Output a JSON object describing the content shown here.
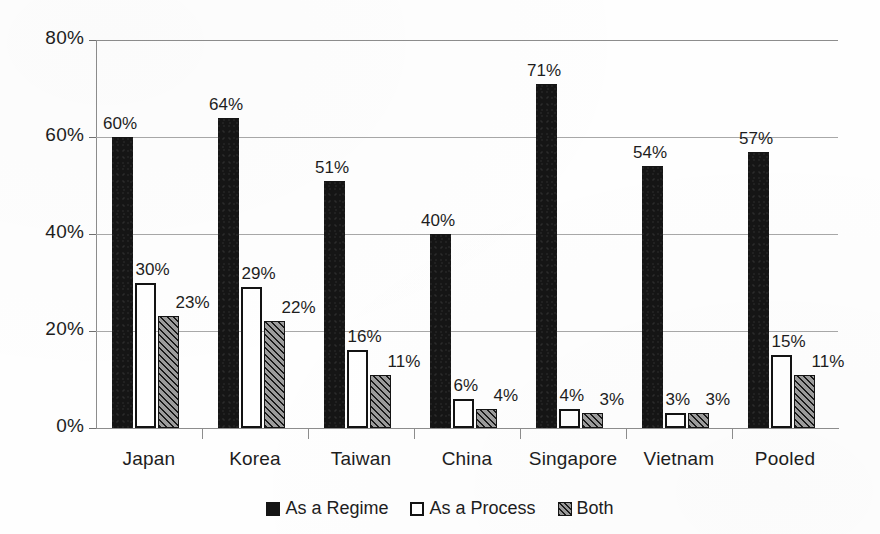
{
  "chart_data": {
    "type": "bar",
    "title": "",
    "subtitle": "",
    "xlabel": "",
    "ylabel": "",
    "ylim": [
      0,
      80
    ],
    "ytick_labels": [
      "0%",
      "20%",
      "40%",
      "60%",
      "80%"
    ],
    "ytick_values": [
      0,
      20,
      40,
      60,
      80
    ],
    "grid": true,
    "legend_position": "bottom-center",
    "value_label_suffix": "%",
    "categories": [
      "Japan",
      "Korea",
      "Taiwan",
      "China",
      "Singapore",
      "Vietnam",
      "Pooled"
    ],
    "series": [
      {
        "name": "As a Regime",
        "style": "solid-black",
        "color": "#151515",
        "values": [
          60,
          64,
          51,
          40,
          71,
          54,
          57
        ],
        "labels": [
          "60%",
          "64%",
          "51%",
          "40%",
          "71%",
          "54%",
          "57%"
        ]
      },
      {
        "name": "As a Process",
        "style": "white-outlined",
        "color": "#ffffff",
        "values": [
          30,
          29,
          16,
          6,
          4,
          3,
          15
        ],
        "labels": [
          "30%",
          "29%",
          "16%",
          "6%",
          "4%",
          "3%",
          "15%"
        ]
      },
      {
        "name": "Both",
        "style": "diagonal-hatch-gray",
        "color": "#9c9c9c",
        "values": [
          23,
          22,
          11,
          4,
          3,
          3,
          11
        ],
        "labels": [
          "23%",
          "22%",
          "11%",
          "4%",
          "3%",
          "3%",
          "11%"
        ]
      }
    ]
  },
  "legend": {
    "items": [
      {
        "label": "As a Regime",
        "swatch": "solid-black-swatch"
      },
      {
        "label": "As a Process",
        "swatch": "white-outlined-swatch"
      },
      {
        "label": "Both",
        "swatch": "hatched-swatch"
      }
    ]
  },
  "axes": {
    "y_labels": [
      "80%",
      "60%",
      "40%",
      "20%",
      "0%"
    ],
    "x_labels": [
      "Japan",
      "Korea",
      "Taiwan",
      "China",
      "Singapore",
      "Vietnam",
      "Pooled"
    ]
  }
}
